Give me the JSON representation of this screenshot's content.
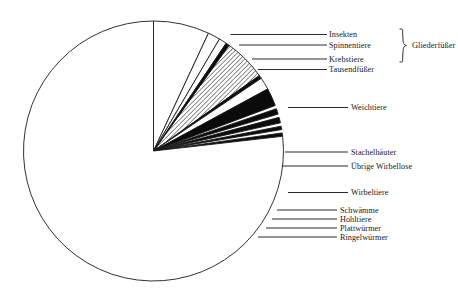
{
  "chart_data": {
    "type": "pie",
    "title": "",
    "subtitle": "",
    "xlabel": "",
    "ylabel": "",
    "legend_position": "right-callout-lines",
    "grid": false,
    "units": "share of described animal species",
    "center": {
      "x": 153.5,
      "y": 151
    },
    "radius": 130,
    "start_angle_deg": 0,
    "direction": "clockwise",
    "categories": [
      "Insekten",
      "Spinnentiere",
      "Krebstiere",
      "Tausendfüßer",
      "Weichtiere",
      "Stachelhäuter",
      "Übrige Wirbellose",
      "Wirbeltiere",
      "Schwämme",
      "Hohltiere",
      "Plattwürmer",
      "Ringelwürmer",
      "Einzeller und Sonstige"
    ],
    "values": [
      25.0,
      5.5,
      3.5,
      1.5,
      19.0,
      1.5,
      5.5,
      8.0,
      2.5,
      2.5,
      1.5,
      1.5,
      222.5
    ],
    "value_unit": "degrees of arc",
    "slices": [
      {
        "label": "Insekten",
        "start_deg": 0.0,
        "end_deg": 25.0,
        "fill": "white",
        "callout": true
      },
      {
        "label": "Spinnentiere",
        "start_deg": 25.0,
        "end_deg": 30.5,
        "fill": "white",
        "callout": true
      },
      {
        "label": "Krebstiere",
        "start_deg": 30.5,
        "end_deg": 34.0,
        "fill": "white",
        "callout": true
      },
      {
        "label": "Tausendfüßer",
        "start_deg": 34.0,
        "end_deg": 35.5,
        "fill": "black",
        "callout": true
      },
      {
        "label": "Weichtiere",
        "start_deg": 35.5,
        "end_deg": 54.5,
        "fill": "hatched",
        "callout": true
      },
      {
        "label": "Stachelhäuter",
        "start_deg": 54.5,
        "end_deg": 56.0,
        "fill": "black",
        "callout": true
      },
      {
        "label": "Übrige Wirbellose",
        "start_deg": 56.0,
        "end_deg": 61.5,
        "fill": "white",
        "callout": true
      },
      {
        "label": "Wirbeltiere",
        "start_deg": 61.5,
        "end_deg": 69.5,
        "fill": "black",
        "callout": true
      },
      {
        "label": "Schwämme",
        "start_deg": 71.0,
        "end_deg": 73.5,
        "fill": "black",
        "callout": true
      },
      {
        "label": "Hohltiere",
        "start_deg": 75.0,
        "end_deg": 77.5,
        "fill": "black",
        "callout": true
      },
      {
        "label": "Plattwürmer",
        "start_deg": 79.0,
        "end_deg": 80.5,
        "fill": "black",
        "callout": true
      },
      {
        "label": "Ringelwürmer",
        "start_deg": 82.0,
        "end_deg": 83.5,
        "fill": "black",
        "callout": true
      },
      {
        "label": "Einzeller und Sonstige",
        "start_deg": 83.5,
        "end_deg": 360.0,
        "fill": "white",
        "callout": false
      }
    ],
    "annotations": [
      {
        "text": "Gliederfüßer",
        "type": "brace-group",
        "members": [
          "Insekten",
          "Spinnentiere",
          "Krebstiere",
          "Tausendfüßer"
        ]
      }
    ]
  },
  "labels": {
    "insekten": "Insekten",
    "spinnentiere": "Spinnentiere",
    "krebstiere": "Krebstiere",
    "tausendfuesser": "Tausendfüßer",
    "gliederfuesser": "Gliederfüßer",
    "weichtiere": "Weichtiere",
    "stachelhaeuter": "Stachelhäuter",
    "uebrige_wirbellose": "Übrige Wirbellose",
    "wirbeltiere": "Wirbeltiere",
    "schwaemme": "Schwämme",
    "hohltiere": "Hohltiere",
    "plattwuermer": "Plattwürmer",
    "ringelwuermer": "Ringelwürmer"
  },
  "colors": {
    "stroke": "#1a1a1a",
    "fill_black": "#0b0b0b",
    "fill_white": "#ffffff",
    "hatch": "#2a2a2a",
    "background": "#ffffff",
    "leader_line": "#2b2b2b"
  }
}
